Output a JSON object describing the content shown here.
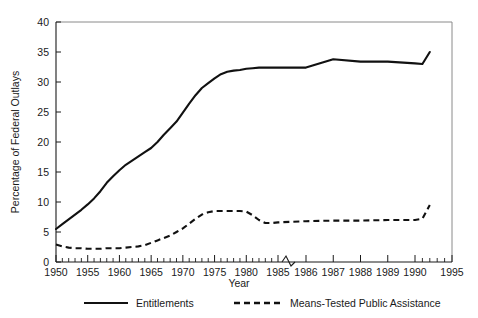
{
  "chart_data": {
    "type": "line",
    "title": "",
    "xlabel": "Year",
    "ylabel": "Percentage of Federal Outlays",
    "ylim": [
      0,
      40
    ],
    "yticks": [
      0,
      5,
      10,
      15,
      20,
      25,
      30,
      35,
      40
    ],
    "xticks_labeled": [
      1950,
      1955,
      1960,
      1965,
      1970,
      1975,
      1980,
      1985,
      1986,
      1987,
      1988,
      1989,
      1990,
      1995
    ],
    "x_axis_note": "broken axis: 1950-1985 compressed, scale break after 1985, 1986-1990 expanded, 1990-1995 compressed",
    "grid": false,
    "legend_position": "below",
    "series": [
      {
        "name": "Entitlements",
        "style": "solid",
        "x": [
          1950,
          1951,
          1952,
          1953,
          1954,
          1955,
          1956,
          1957,
          1958,
          1959,
          1960,
          1961,
          1962,
          1963,
          1964,
          1965,
          1966,
          1967,
          1968,
          1969,
          1970,
          1971,
          1972,
          1973,
          1974,
          1975,
          1976,
          1977,
          1978,
          1979,
          1980,
          1981,
          1982,
          1983,
          1984,
          1985,
          1986,
          1987,
          1988,
          1989,
          1990,
          1991,
          1992
        ],
        "values": [
          5.5,
          6.3,
          7.1,
          7.9,
          8.7,
          9.6,
          10.6,
          11.8,
          13.2,
          14.3,
          15.3,
          16.2,
          16.9,
          17.6,
          18.3,
          19.0,
          20.0,
          21.2,
          22.3,
          23.4,
          24.9,
          26.4,
          27.8,
          29.0,
          29.8,
          30.6,
          31.3,
          31.7,
          31.9,
          32.0,
          32.2,
          32.3,
          32.4,
          32.4,
          32.4,
          32.4,
          32.4,
          33.8,
          33.4,
          33.4,
          33.1,
          33.0,
          35.0
        ]
      },
      {
        "name": "Means-Tested Public Assistance",
        "style": "dashed",
        "x": [
          1950,
          1951,
          1952,
          1953,
          1954,
          1955,
          1956,
          1957,
          1958,
          1959,
          1960,
          1961,
          1962,
          1963,
          1964,
          1965,
          1966,
          1967,
          1968,
          1969,
          1970,
          1971,
          1972,
          1973,
          1974,
          1975,
          1976,
          1977,
          1978,
          1979,
          1980,
          1981,
          1982,
          1983,
          1984,
          1985,
          1986,
          1987,
          1988,
          1989,
          1990,
          1991,
          1992
        ],
        "values": [
          2.9,
          2.6,
          2.4,
          2.3,
          2.3,
          2.2,
          2.2,
          2.2,
          2.3,
          2.3,
          2.3,
          2.4,
          2.5,
          2.6,
          2.8,
          3.2,
          3.6,
          4.0,
          4.4,
          5.0,
          5.6,
          6.4,
          7.2,
          7.9,
          8.3,
          8.5,
          8.5,
          8.5,
          8.5,
          8.5,
          8.4,
          7.8,
          7.0,
          6.5,
          6.5,
          6.6,
          6.8,
          6.9,
          6.9,
          7.0,
          7.0,
          7.2,
          9.5
        ]
      }
    ]
  },
  "axes": {
    "y_title": "Percentage of Federal Outlays",
    "x_title": "Year",
    "y_tick_labels": [
      "40",
      "35",
      "30",
      "25",
      "20",
      "15",
      "10",
      "5",
      "0"
    ],
    "x_tick_labels": [
      "1950",
      "1955",
      "1960",
      "1965",
      "1970",
      "1975",
      "1980",
      "1985",
      "1986",
      "1987",
      "1988",
      "1989",
      "1990",
      "1995"
    ]
  },
  "legend": {
    "items": [
      {
        "label": "Entitlements",
        "style": "solid"
      },
      {
        "label": "Means-Tested Public Assistance",
        "style": "dashed"
      }
    ]
  }
}
